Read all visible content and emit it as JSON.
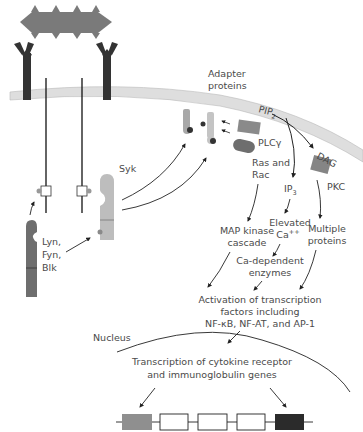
{
  "diagram": {
    "colors": {
      "antigen": "#7a7a7a",
      "receptor_arms": "#333333",
      "membrane": "#dedede",
      "membrane_edge": "#b8b8b8",
      "lyn_kinase": "#6e6e6e",
      "syk_kinase": "#bdbdbd",
      "adapter": "#a8a8a8",
      "plc": "#8a8a8a",
      "ras": "#6e6e6e",
      "pkc": "#858585",
      "gene_left": "#8f8f8f",
      "gene_right": "#2b2b2b",
      "text": "#4a4a4a",
      "arrow": "#222222"
    },
    "labels": {
      "adapter_line1": "Adapter",
      "adapter_line2": "proteins",
      "pip2": "PIP",
      "pip2_sub": "2",
      "dag": "DAG",
      "plc": "PLCγ",
      "ras_line1": "Ras and",
      "ras_line2": "Rac",
      "ip3": "IP",
      "ip3_sub": "3",
      "pkc": "PKC",
      "syk": "Syk",
      "lyn_line1": "Lyn,",
      "lyn_line2": "Fyn,",
      "lyn_line3": "Blk",
      "map_line1": "MAP kinase",
      "map_line2": "cascade",
      "ca_line1": "Elevated",
      "ca_line2": "Ca",
      "ca_sup": "++",
      "multi_line1": "Multiple",
      "multi_line2": "proteins",
      "cadep_line1": "Ca-dependent",
      "cadep_line2": "enzymes",
      "act_line1": "Activation of transcription",
      "act_line2": "factors including",
      "act_line3": "NF-κB, NF-AT, and AP-1",
      "nucleus": "Nucleus",
      "trans_line1": "Transcription of cytokine receptor",
      "trans_line2": "and immunoglobulin genes"
    },
    "gene": {
      "exons": [
        "filled-gray",
        "open",
        "open",
        "open",
        "filled-black"
      ]
    }
  }
}
